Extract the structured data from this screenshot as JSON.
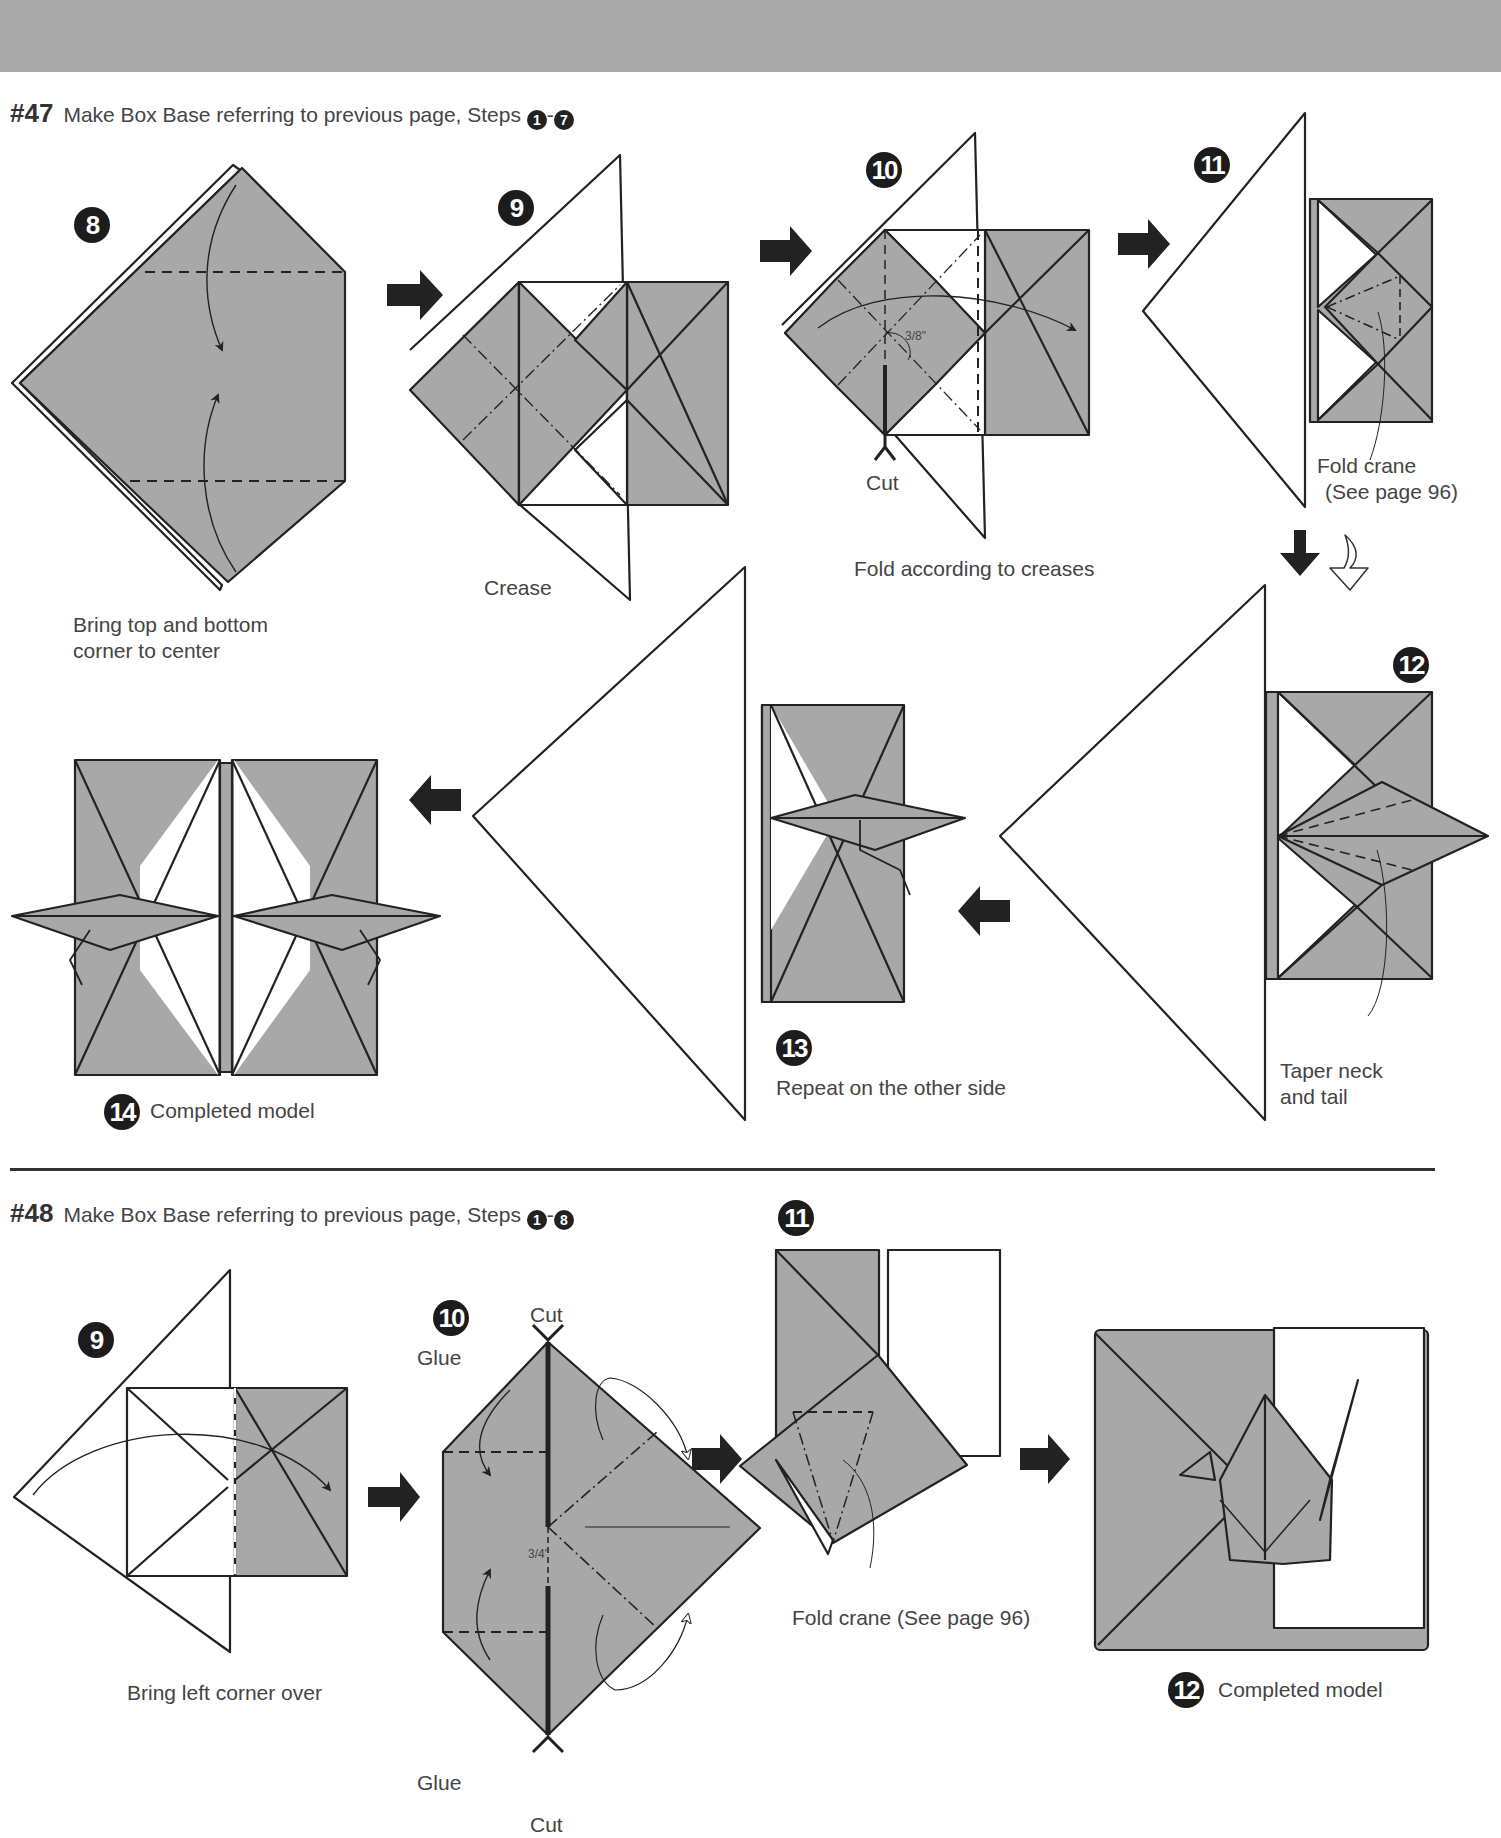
{
  "colors": {
    "header_band": "#a9a9a9",
    "paper_gray": "#a8a8a8",
    "line": "#222222",
    "text": "#444444"
  },
  "section47": {
    "number": "#47",
    "instruction": "Make Box Base referring to previous page, Steps",
    "range_start": "1",
    "range_sep": "-",
    "range_end": "7",
    "steps": [
      {
        "num": "8",
        "caption_line1": "Bring top and bottom",
        "caption_line2": "corner to center"
      },
      {
        "num": "9",
        "caption": "Crease"
      },
      {
        "num": "10",
        "caption": "Fold according to creases",
        "cut_label": "Cut",
        "measure": "3/8\""
      },
      {
        "num": "11",
        "caption_line1": "Fold crane",
        "caption_line2": "(See page 96)"
      },
      {
        "num": "12",
        "caption_line1": "Taper neck",
        "caption_line2": "and tail"
      },
      {
        "num": "13",
        "caption": "Repeat on the other side"
      },
      {
        "num": "14",
        "caption": "Completed model"
      }
    ]
  },
  "section48": {
    "number": "#48",
    "instruction": "Make Box Base referring to previous page, Steps",
    "range_start": "1",
    "range_sep": "-",
    "range_end": "8",
    "steps": [
      {
        "num": "9",
        "caption": "Bring left corner over"
      },
      {
        "num": "10",
        "glue_top": "Glue",
        "glue_bottom": "Glue",
        "cut_top": "Cut",
        "cut_bottom": "Cut",
        "measure": "3/4\""
      },
      {
        "num": "11",
        "caption": "Fold crane (See page 96)"
      },
      {
        "num": "12",
        "caption": "Completed model"
      }
    ]
  }
}
